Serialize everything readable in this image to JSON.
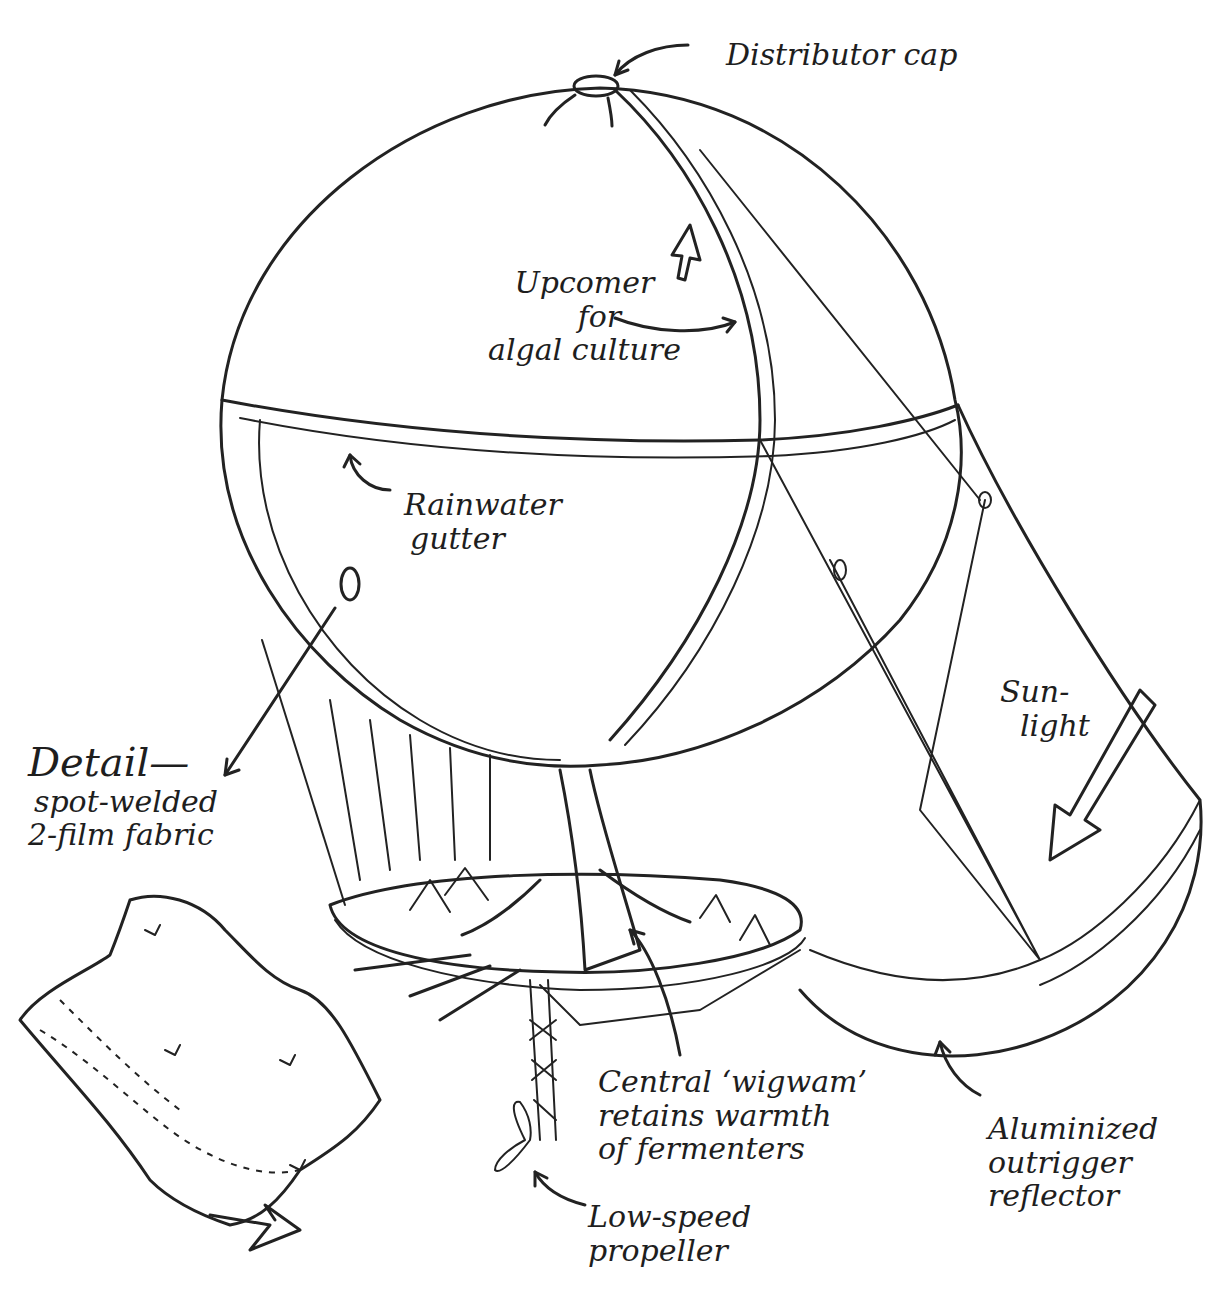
{
  "diagram": {
    "labels": {
      "distributor_cap": "Distributor cap",
      "upcomer": [
        "Upcomer",
        "for",
        "algal culture"
      ],
      "rainwater_gutter": [
        "Rainwater",
        "gutter"
      ],
      "detail": [
        "Detail—",
        "spot-welded",
        "2-film fabric"
      ],
      "sunlight": [
        "Sun-",
        "light"
      ],
      "central_wigwam": [
        "Central ‘wigwam’",
        "retains warmth",
        "of fermenters"
      ],
      "low_speed_propeller": [
        "Low-speed",
        "propeller"
      ],
      "aluminized_reflector": [
        "Aluminized",
        "outrigger",
        "reflector"
      ]
    }
  }
}
